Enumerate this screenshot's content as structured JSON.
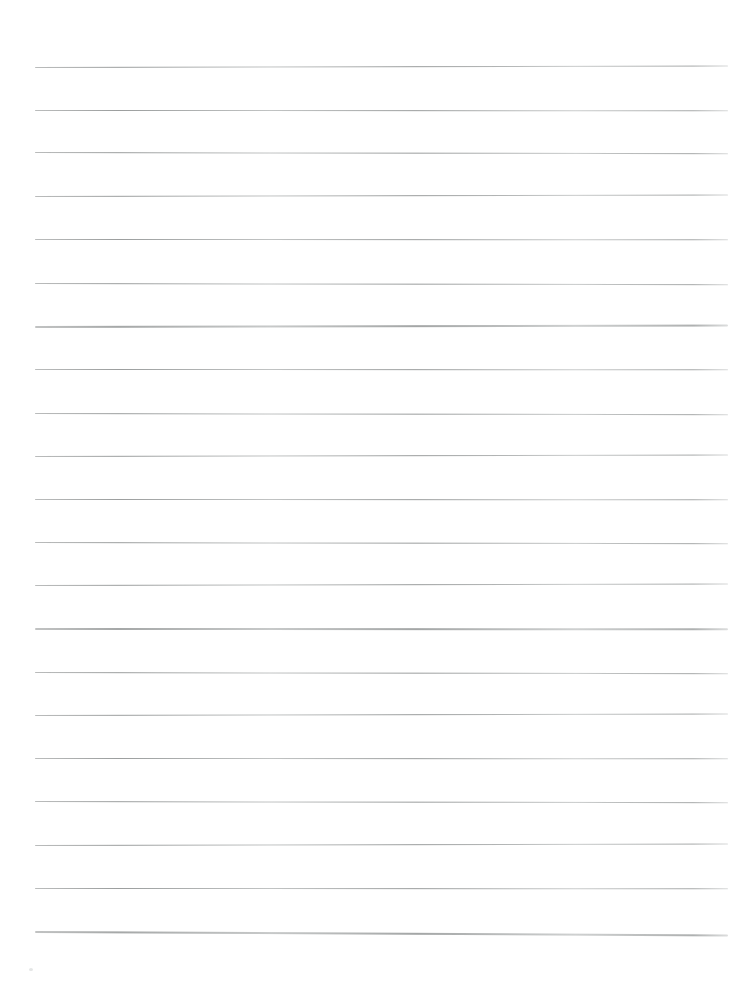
{
  "page": {
    "background_color": "#ffffff"
  },
  "rule_lines": {
    "count": 21,
    "color": "#9b9e9e",
    "left_x": 35,
    "right_x": 728,
    "y_positions": [
      67,
      110,
      152,
      196,
      239,
      283,
      326,
      369,
      413,
      456,
      499,
      542,
      585,
      628,
      672,
      715,
      758,
      801,
      845,
      888,
      931
    ]
  },
  "artifacts": {
    "speck": {
      "x": 29,
      "y": 968,
      "color": "#d9dbdb"
    }
  }
}
